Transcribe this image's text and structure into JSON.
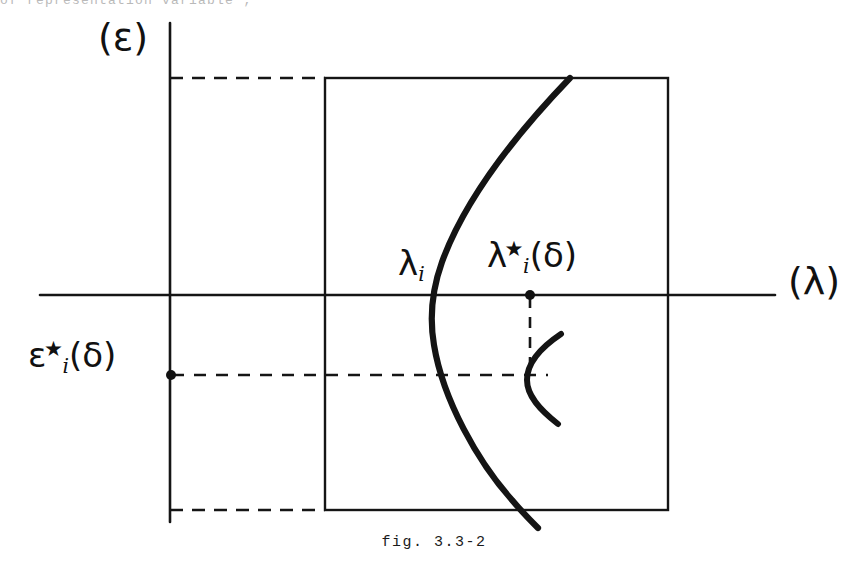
{
  "page": {
    "header_text_faint": "of  representation  variable ;",
    "caption": "fig. 3.3-2"
  },
  "figure": {
    "axes": {
      "vertical_axis_label": "(ε)",
      "horizontal_axis_label": "(λ)"
    },
    "annotations": {
      "lambda_i": {
        "base": "λ",
        "subscript": "i",
        "star": "",
        "suffix": ""
      },
      "lambda_i_star_delta": {
        "base": "λ",
        "star": "★",
        "subscript": "i",
        "suffix": "(δ)"
      },
      "epsilon_i_star_delta": {
        "base": "ε",
        "star": "★",
        "subscript": "i",
        "suffix": "(δ)"
      }
    },
    "colors": {
      "ink": "#111111",
      "background": "#ffffff",
      "faint_ink": "#8f8f8f"
    },
    "geometry": {
      "vertical_axis_x": 170,
      "horizontal_axis_y": 295,
      "rect_left": 325,
      "rect_top": 78,
      "rect_right": 668,
      "rect_bottom": 510,
      "lambda_i_x": 437,
      "lambda_star_x": 530,
      "epsilon_star_y": 375,
      "curve_top_x": 570,
      "curve_bottom_x": 612
    }
  }
}
